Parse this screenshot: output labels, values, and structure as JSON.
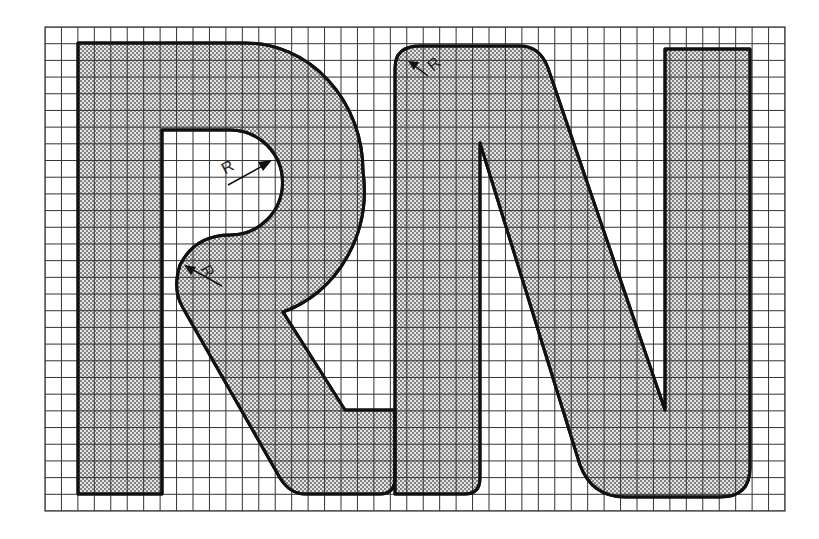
{
  "figure": {
    "title": "",
    "letters": [
      "R",
      "N"
    ],
    "colors": {
      "background": "#ffffff",
      "grid_line": "#333333",
      "outline": "#111111",
      "fill_base": "#e6e6e6",
      "stipple_dot": "#555555"
    },
    "grid": {
      "left": 45,
      "top": 27,
      "right": 785,
      "bottom": 511,
      "columns": 45,
      "rows": 29
    },
    "annotations": [
      {
        "id": "radius-counter",
        "text": "R"
      },
      {
        "id": "radius-junction",
        "text": "R"
      },
      {
        "id": "radius-n-corner",
        "text": "R"
      }
    ]
  }
}
